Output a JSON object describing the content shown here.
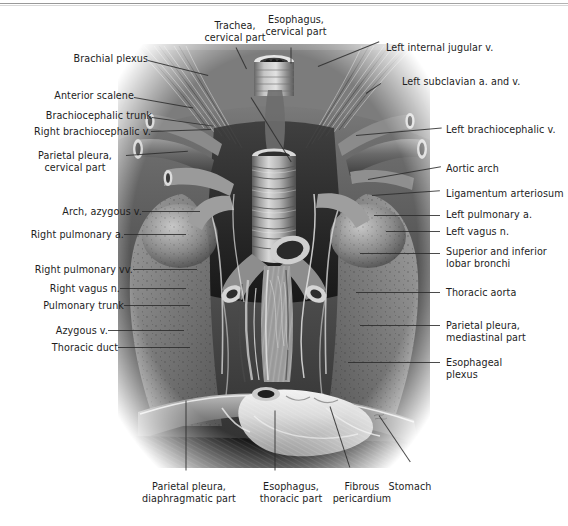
{
  "plate": {
    "title": "Mediastinum, anterior view",
    "artist_signature": "illegible-signature"
  },
  "labels": {
    "left": [
      {
        "id": "brachial-plexus",
        "text": "Brachial plexus"
      },
      {
        "id": "anterior-scalene",
        "text": "Anterior scalene"
      },
      {
        "id": "brachiocephalic-trunk",
        "text": "Brachiocephalic trunk"
      },
      {
        "id": "right-brachiocephalic-v",
        "text": "Right brachiocephalic v."
      },
      {
        "id": "parietal-pleura-cervical",
        "text": "Parietal pleura,\ncervical part"
      },
      {
        "id": "arch-azygous-v",
        "text": "Arch, azygous v."
      },
      {
        "id": "right-pulmonary-a",
        "text": "Right pulmonary a."
      },
      {
        "id": "right-pulmonary-vv",
        "text": "Right pulmonary vv."
      },
      {
        "id": "right-vagus-n",
        "text": "Right vagus n."
      },
      {
        "id": "pulmonary-trunk",
        "text": "Pulmonary trunk"
      },
      {
        "id": "azygous-v",
        "text": "Azygous v."
      },
      {
        "id": "thoracic-duct",
        "text": "Thoracic duct"
      }
    ],
    "top": [
      {
        "id": "trachea-cervical",
        "text": "Trachea,\ncervical part"
      },
      {
        "id": "esophagus-cervical",
        "text": "Esophagus,\ncervical part"
      }
    ],
    "right": [
      {
        "id": "left-internal-jugular-v",
        "text": "Left internal jugular v."
      },
      {
        "id": "left-subclavian-a-and-v",
        "text": "Left subclavian a. and v."
      },
      {
        "id": "left-brachiocephalic-v",
        "text": "Left brachiocephalic v."
      },
      {
        "id": "aortic-arch",
        "text": "Aortic arch"
      },
      {
        "id": "ligamentum-arteriosum",
        "text": "Ligamentum arteriosum"
      },
      {
        "id": "left-pulmonary-a",
        "text": "Left pulmonary a."
      },
      {
        "id": "left-vagus-n",
        "text": "Left vagus n."
      },
      {
        "id": "lobar-bronchi",
        "text": "Superior and inferior\nlobar bronchi"
      },
      {
        "id": "thoracic-aorta",
        "text": "Thoracic aorta"
      },
      {
        "id": "parietal-pleura-mediastinal",
        "text": "Parietal pleura,\nmediastinal part"
      },
      {
        "id": "esophageal-plexus",
        "text": "Esophageal\nplexus"
      }
    ],
    "bottom": [
      {
        "id": "parietal-pleura-diaphragmatic",
        "text": "Parietal pleura,\ndiaphragmatic part"
      },
      {
        "id": "esophagus-thoracic",
        "text": "Esophagus,\nthoracic part"
      },
      {
        "id": "fibrous-pericardium",
        "text": "Fibrous\npericardium"
      },
      {
        "id": "stomach",
        "text": "Stomach"
      }
    ]
  },
  "colors": {
    "text": "#1d1d1d",
    "leader": "#2b2b2b",
    "page": "#ffffff"
  }
}
